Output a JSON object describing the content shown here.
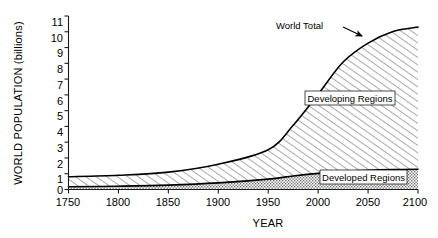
{
  "chart_data": {
    "type": "area",
    "title": "",
    "xlabel": "YEAR",
    "ylabel": "WORLD POPULATION (billions)",
    "xlim": [
      1750,
      2100
    ],
    "ylim": [
      0,
      11
    ],
    "grid": false,
    "stacked": true,
    "legend_position": "inline-annotations",
    "x_ticks": [
      "1750",
      "1800",
      "1850",
      "1900",
      "1950",
      "2000",
      "2050",
      "2100"
    ],
    "y_ticks": [
      "0",
      "1",
      "2",
      "3",
      "4",
      "5",
      "6",
      "7",
      "8",
      "9",
      "10",
      "11"
    ],
    "x": [
      1750,
      1800,
      1850,
      1900,
      1950,
      1975,
      2000,
      2025,
      2050,
      2075,
      2100
    ],
    "series": [
      {
        "name": "Developed Regions",
        "fill": "stipple",
        "values": [
          0.17,
          0.21,
          0.28,
          0.42,
          0.66,
          0.86,
          1.02,
          1.15,
          1.22,
          1.26,
          1.28
        ]
      },
      {
        "name": "Developing Regions",
        "fill": "diagonal-hatch",
        "values": [
          0.64,
          0.69,
          0.82,
          1.18,
          1.86,
          3.21,
          5.02,
          6.93,
          8.06,
          8.76,
          9.02
        ]
      }
    ],
    "total_series": {
      "name": "World Total",
      "values": [
        0.81,
        0.9,
        1.1,
        1.6,
        2.52,
        4.07,
        6.04,
        8.08,
        9.28,
        10.02,
        10.3
      ]
    },
    "annotations": [
      {
        "text": "World Total",
        "points_to": "total-curve"
      },
      {
        "text": "Developing Regions",
        "in_band": "developing"
      },
      {
        "text": "Developed Regions",
        "in_band": "developed"
      }
    ]
  },
  "axes": {
    "y_title": "WORLD POPULATION (billions)",
    "x_title": "YEAR",
    "y_tick_0": "0",
    "y_tick_1": "1",
    "y_tick_2": "2",
    "y_tick_3": "3",
    "y_tick_4": "4",
    "y_tick_5": "5",
    "y_tick_6": "6",
    "y_tick_7": "7",
    "y_tick_8": "8",
    "y_tick_9": "9",
    "y_tick_10": "10",
    "y_tick_11": "11",
    "x_tick_0": "1750",
    "x_tick_1": "1800",
    "x_tick_2": "1850",
    "x_tick_3": "1900",
    "x_tick_4": "1950",
    "x_tick_5": "2000",
    "x_tick_6": "2050",
    "x_tick_7": "2100"
  },
  "labels": {
    "world_total": "World Total",
    "developing_regions": "Developing Regions",
    "developed_regions": "Developed Regions"
  },
  "colors": {
    "ink": "#000000",
    "background": "#ffffff",
    "hatch": "#5a5a5a",
    "stipple": "#6e6e6e"
  }
}
